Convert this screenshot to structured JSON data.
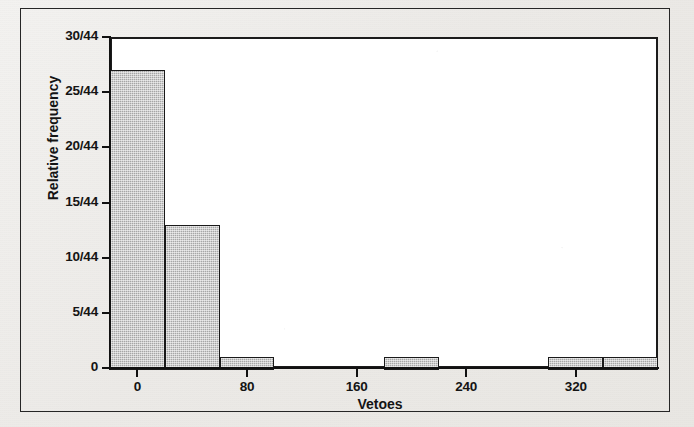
{
  "figure": {
    "background_color": "#efeeec",
    "frame_color": "#262626",
    "plot_background": "#ffffff",
    "bar_fill": "#a6a6a6",
    "bar_edge": "#1a1a1a"
  },
  "chart_data": {
    "type": "bar",
    "title": "",
    "subtitle": "",
    "xlabel": "Vetoes",
    "ylabel": "Relative frequency",
    "grid": false,
    "legend": null,
    "xlim": [
      -20,
      380
    ],
    "ylim": [
      0,
      30
    ],
    "xticks": [
      0,
      80,
      160,
      240,
      320
    ],
    "xtick_labels": [
      "0",
      "80",
      "160",
      "240",
      "320"
    ],
    "yticks": [
      0,
      5,
      10,
      15,
      20,
      25,
      30
    ],
    "ytick_labels": [
      "0",
      "5/44",
      "10/44",
      "15/44",
      "20/44",
      "25/44",
      "30/44"
    ],
    "bin_width": 40,
    "sample_size": 44,
    "bins": [
      {
        "left": -20,
        "right": 20,
        "count": 27,
        "label": "27/44"
      },
      {
        "left": 20,
        "right": 60,
        "count": 13,
        "label": "13/44"
      },
      {
        "left": 60,
        "right": 100,
        "count": 1,
        "label": "1/44"
      },
      {
        "left": 100,
        "right": 140,
        "count": 0,
        "label": "0"
      },
      {
        "left": 140,
        "right": 180,
        "count": 0,
        "label": "0"
      },
      {
        "left": 180,
        "right": 220,
        "count": 1,
        "label": "1/44"
      },
      {
        "left": 220,
        "right": 260,
        "count": 0,
        "label": "0"
      },
      {
        "left": 260,
        "right": 300,
        "count": 0,
        "label": "0"
      },
      {
        "left": 300,
        "right": 340,
        "count": 1,
        "label": "1/44"
      },
      {
        "left": 340,
        "right": 380,
        "count": 1,
        "label": "1/44"
      }
    ],
    "categories": [
      "-20 to 20",
      "20 to 60",
      "60 to 100",
      "100 to 140",
      "140 to 180",
      "180 to 220",
      "220 to 260",
      "260 to 300",
      "300 to 340",
      "340 to 380"
    ],
    "values": [
      27,
      13,
      1,
      0,
      0,
      1,
      0,
      0,
      1,
      1
    ]
  }
}
